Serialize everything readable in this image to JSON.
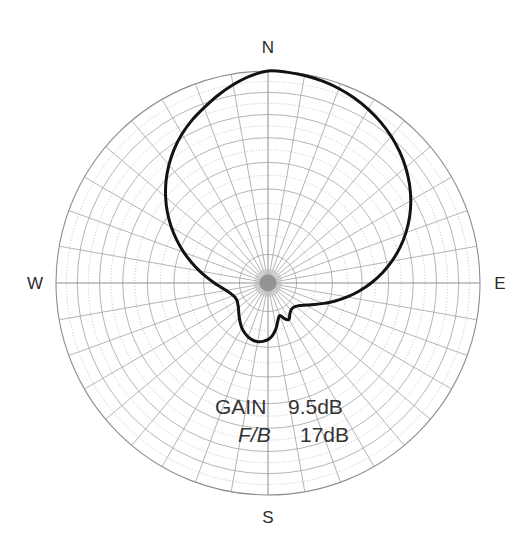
{
  "chart_data": {
    "type": "line",
    "plot_style": "polar",
    "title": "",
    "subtitle": "",
    "xlabel": "",
    "ylabel": "",
    "grid": true,
    "legend_position": "none",
    "center_px": [
      268,
      283
    ],
    "outer_radius_px": 212,
    "radial_scale": "logarithmic-dB",
    "radial_range_db": [
      -40,
      0
    ],
    "ring_count": 15,
    "spoke_count": 36,
    "spoke_step_deg": 10,
    "cardinals": [
      {
        "label": "N",
        "angle_deg": 0
      },
      {
        "label": "E",
        "angle_deg": 90
      },
      {
        "label": "S",
        "angle_deg": 180
      },
      {
        "label": "W",
        "angle_deg": 270
      }
    ],
    "annotations": [
      {
        "name": "gain",
        "label": "GAIN",
        "value": "9.5dB",
        "italic": false
      },
      {
        "name": "front-to-back",
        "label": "F/B",
        "value": "17dB",
        "italic": true
      }
    ],
    "series": [
      {
        "name": "radiation-pattern",
        "color": "#121212",
        "closed": true,
        "angles_deg": [
          0,
          5,
          10,
          15,
          20,
          25,
          30,
          35,
          40,
          45,
          50,
          55,
          60,
          65,
          70,
          75,
          80,
          85,
          90,
          95,
          100,
          105,
          110,
          115,
          120,
          125,
          130,
          135,
          140,
          145,
          150,
          155,
          160,
          165,
          170,
          175,
          180,
          185,
          190,
          195,
          200,
          205,
          210,
          215,
          220,
          225,
          230,
          235,
          240,
          245,
          250,
          255,
          260,
          265,
          270,
          275,
          280,
          285,
          290,
          295,
          300,
          305,
          310,
          315,
          320,
          325,
          330,
          335,
          340,
          345,
          350,
          355
        ],
        "radii_norm": [
          1.0,
          0.998,
          0.992,
          0.982,
          0.968,
          0.95,
          0.928,
          0.902,
          0.872,
          0.838,
          0.8,
          0.758,
          0.712,
          0.662,
          0.608,
          0.552,
          0.494,
          0.436,
          0.378,
          0.322,
          0.27,
          0.222,
          0.18,
          0.146,
          0.12,
          0.102,
          0.092,
          0.088,
          0.09,
          0.098,
          0.112,
          0.104,
          0.086,
          0.1,
          0.128,
          0.152,
          0.168,
          0.176,
          0.18,
          0.178,
          0.172,
          0.162,
          0.15,
          0.136,
          0.122,
          0.11,
          0.1,
          0.094,
          0.09,
          0.09,
          0.094,
          0.102,
          0.114,
          0.132,
          0.156,
          0.186,
          0.222,
          0.264,
          0.312,
          0.364,
          0.42,
          0.478,
          0.536,
          0.594,
          0.65,
          0.704,
          0.754,
          0.8,
          0.842,
          0.888,
          0.932,
          0.972
        ]
      }
    ]
  }
}
